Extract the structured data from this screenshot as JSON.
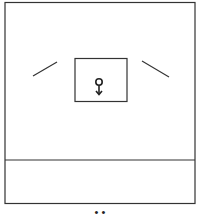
{
  "diagram": {
    "symbol": "female-symbol",
    "symbol_glyph": "♀",
    "caption": "• •",
    "stroke_color": "#333333",
    "background_color": "#ffffff"
  }
}
